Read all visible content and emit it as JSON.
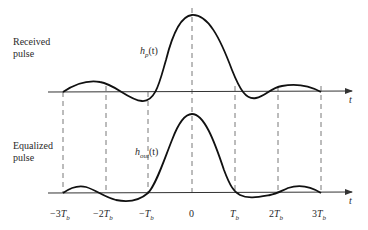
{
  "panels": {
    "received": {
      "title_line1": "Received",
      "title_line2": "pulse",
      "function_label": "h",
      "function_sub": "p",
      "function_arg": "(t)"
    },
    "equalized": {
      "title_line1": "Equalized",
      "title_line2": "pulse",
      "function_label": "h",
      "function_sub": "out",
      "function_arg": "(t)"
    }
  },
  "axis": {
    "label": "t"
  },
  "ticks": [
    {
      "prefix": "−3",
      "var": "T",
      "sub": "b"
    },
    {
      "prefix": "−2",
      "var": "T",
      "sub": "b"
    },
    {
      "prefix": "−",
      "var": "T",
      "sub": "b"
    },
    {
      "prefix": "0",
      "var": "",
      "sub": ""
    },
    {
      "prefix": "",
      "var": "T",
      "sub": "b"
    },
    {
      "prefix": "2",
      "var": "T",
      "sub": "b"
    },
    {
      "prefix": "3",
      "var": "T",
      "sub": "b"
    }
  ],
  "colors": {
    "curve": "#111111",
    "axis": "#333333",
    "dashed": "#555555"
  }
}
